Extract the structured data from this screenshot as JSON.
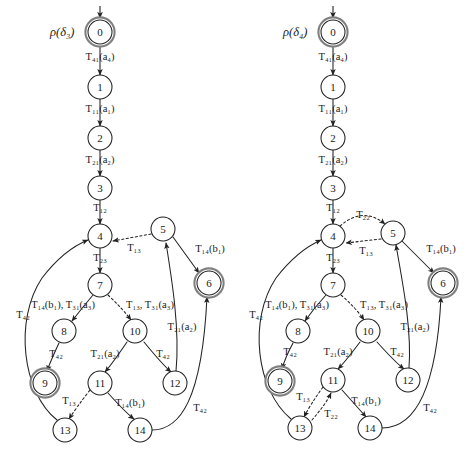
{
  "figure": {
    "type": "state-transition-diagram-pair",
    "background": "#ffffff",
    "stroke": "#222222",
    "accepting_ring": "#808080"
  },
  "diagrams": [
    {
      "id": "left",
      "title": "ρ(δ₃)",
      "title_pos": {
        "x": 50,
        "y": 36
      },
      "origin_x": 0,
      "nodes": [
        {
          "id": "0",
          "label": "0",
          "x": 100,
          "y": 32,
          "r": 12,
          "accepting": true
        },
        {
          "id": "1",
          "label": "1",
          "x": 100,
          "y": 87,
          "r": 12,
          "accepting": false
        },
        {
          "id": "2",
          "label": "2",
          "x": 100,
          "y": 138,
          "r": 12,
          "accepting": false
        },
        {
          "id": "3",
          "label": "3",
          "x": 100,
          "y": 188,
          "r": 12,
          "accepting": false
        },
        {
          "id": "4",
          "label": "4",
          "x": 100,
          "y": 236,
          "r": 12,
          "accepting": false
        },
        {
          "id": "5",
          "label": "5",
          "x": 163,
          "y": 229,
          "r": 12,
          "accepting": false
        },
        {
          "id": "6",
          "label": "6",
          "x": 209,
          "y": 283,
          "r": 12,
          "accepting": true
        },
        {
          "id": "7",
          "label": "7",
          "x": 100,
          "y": 285,
          "r": 12,
          "accepting": false
        },
        {
          "id": "8",
          "label": "8",
          "x": 64,
          "y": 331,
          "r": 12,
          "accepting": false
        },
        {
          "id": "9",
          "label": "9",
          "x": 45,
          "y": 383,
          "r": 12,
          "accepting": true
        },
        {
          "id": "10",
          "label": "10",
          "x": 135,
          "y": 331,
          "r": 12,
          "accepting": false
        },
        {
          "id": "11",
          "label": "11",
          "x": 100,
          "y": 383,
          "r": 12,
          "accepting": false
        },
        {
          "id": "12",
          "label": "12",
          "x": 175,
          "y": 383,
          "r": 12,
          "accepting": false
        },
        {
          "id": "13",
          "label": "13",
          "x": 65,
          "y": 430,
          "r": 12,
          "accepting": false
        },
        {
          "id": "14",
          "label": "14",
          "x": 140,
          "y": 430,
          "r": 12,
          "accepting": false
        }
      ],
      "start_arrow": {
        "x": 100,
        "y_from": 6,
        "y_to": 18
      },
      "edges": [
        {
          "from": "0",
          "to": "1",
          "label": "T₄₁(a₄)",
          "lx": 100,
          "ly": 60,
          "dotted": false,
          "anchor": "middle"
        },
        {
          "from": "1",
          "to": "2",
          "label": "T₁₁(a₁)",
          "lx": 100,
          "ly": 112,
          "dotted": false,
          "anchor": "middle"
        },
        {
          "from": "2",
          "to": "3",
          "label": "T₂₁(a₂)",
          "lx": 100,
          "ly": 163,
          "dotted": false,
          "anchor": "middle"
        },
        {
          "from": "3",
          "to": "4",
          "label": "T₁₂",
          "lx": 100,
          "ly": 211,
          "dotted": false,
          "anchor": "middle"
        },
        {
          "from": "5",
          "to": "4",
          "label": "T₁₃",
          "lx": 134,
          "ly": 251,
          "dotted": true,
          "anchor": "middle"
        },
        {
          "from": "5",
          "to": "6",
          "label": "T₁₄(b₁)",
          "lx": 210,
          "ly": 252,
          "dotted": false,
          "anchor": "middle"
        },
        {
          "from": "4",
          "to": "7",
          "label": "T₂₃",
          "lx": 100,
          "ly": 261,
          "dotted": false,
          "anchor": "middle"
        },
        {
          "from": "7",
          "to": "8",
          "label": "T₁₄(b₁), T₃₁(a₃)",
          "lx": 63,
          "ly": 308,
          "dotted": false,
          "anchor": "middle"
        },
        {
          "from": "7",
          "to": "10",
          "label": "T₁₃, T₃₁(a₃)",
          "lx": 150,
          "ly": 308,
          "dotted": true,
          "anchor": "middle"
        },
        {
          "from": "8",
          "to": "9",
          "label": "T₄₂",
          "lx": 56,
          "ly": 357,
          "dotted": false,
          "anchor": "middle"
        },
        {
          "from": "10",
          "to": "11",
          "label": "T₂₁(a₂)",
          "lx": 105,
          "ly": 357,
          "dotted": false,
          "anchor": "middle"
        },
        {
          "from": "10",
          "to": "12",
          "label": "T₄₂",
          "lx": 163,
          "ly": 357,
          "dotted": false,
          "anchor": "middle"
        },
        {
          "from": "11",
          "to": "13",
          "label": "T₁₃",
          "lx": 69,
          "ly": 404,
          "dotted": true,
          "anchor": "middle"
        },
        {
          "from": "11",
          "to": "14",
          "label": "T₁₄(b₁)",
          "lx": 130,
          "ly": 406,
          "dotted": false,
          "anchor": "middle"
        },
        {
          "from": "13",
          "to": "4",
          "label": "T₄₂",
          "lx": 23,
          "ly": 318,
          "dotted": false,
          "anchor": "middle"
        },
        {
          "from": "12",
          "to": "5",
          "label": "T₂₁(a₂)",
          "lx": 182,
          "ly": 330,
          "dotted": false,
          "anchor": "middle"
        },
        {
          "from": "14",
          "to": "6",
          "label": "T₄₂",
          "lx": 200,
          "ly": 411,
          "dotted": false,
          "anchor": "middle"
        }
      ],
      "paths": [
        {
          "name": "e-0-1",
          "d": "M100,44 L100,75",
          "dotted": false
        },
        {
          "name": "e-1-2",
          "d": "M100,99 L100,126",
          "dotted": false
        },
        {
          "name": "e-2-3",
          "d": "M100,150 L100,176",
          "dotted": false
        },
        {
          "name": "e-3-4",
          "d": "M100,200 L100,224",
          "dotted": false
        },
        {
          "name": "e-5-4",
          "d": "M151,234 L113,241",
          "dotted": true
        },
        {
          "name": "e-5-6",
          "d": "M173,237 L199,273",
          "dotted": false
        },
        {
          "name": "e-4-7",
          "d": "M100,248 L100,273",
          "dotted": false
        },
        {
          "name": "e-7-8",
          "d": "M93,295 Q82,308 72,321",
          "dotted": false
        },
        {
          "name": "e-7-10",
          "d": "M108,295 Q122,308 131,320",
          "dotted": true
        },
        {
          "name": "e-8-9",
          "d": "M59,343 Q51,360 47,371",
          "dotted": false
        },
        {
          "name": "e-10-11",
          "d": "M127,342 Q112,364 105,372",
          "dotted": false
        },
        {
          "name": "e-10-12",
          "d": "M144,342 Q162,364 171,372",
          "dotted": false
        },
        {
          "name": "e-11-13",
          "d": "M90,390 Q76,408 69,419",
          "dotted": true
        },
        {
          "name": "e-11-14",
          "d": "M108,393 Q126,413 134,419",
          "dotted": false
        },
        {
          "name": "e-13-4",
          "d": "M57,420 C22,392 14,320 42,278 C62,252 78,244 88,240",
          "dotted": false
        },
        {
          "name": "e-12-5",
          "d": "M176,371 C180,330 172,280 166,243",
          "dotted": false
        },
        {
          "name": "e-14-6",
          "d": "M152,430 C180,430 202,400 207,297",
          "dotted": false
        }
      ]
    },
    {
      "id": "right",
      "title": "ρ(δ₄)",
      "title_pos": {
        "x": 283,
        "y": 36
      },
      "origin_x": 235,
      "nodes": [
        {
          "id": "0",
          "label": "0",
          "x": 333,
          "y": 32,
          "r": 12,
          "accepting": true
        },
        {
          "id": "1",
          "label": "1",
          "x": 333,
          "y": 87,
          "r": 12,
          "accepting": false
        },
        {
          "id": "2",
          "label": "2",
          "x": 333,
          "y": 138,
          "r": 12,
          "accepting": false
        },
        {
          "id": "3",
          "label": "3",
          "x": 333,
          "y": 188,
          "r": 12,
          "accepting": false
        },
        {
          "id": "4",
          "label": "4",
          "x": 333,
          "y": 236,
          "r": 12,
          "accepting": false
        },
        {
          "id": "5",
          "label": "5",
          "x": 393,
          "y": 233,
          "r": 12,
          "accepting": false
        },
        {
          "id": "6",
          "label": "6",
          "x": 443,
          "y": 283,
          "r": 12,
          "accepting": true
        },
        {
          "id": "7",
          "label": "7",
          "x": 333,
          "y": 285,
          "r": 12,
          "accepting": false
        },
        {
          "id": "8",
          "label": "8",
          "x": 298,
          "y": 331,
          "r": 12,
          "accepting": false
        },
        {
          "id": "9",
          "label": "9",
          "x": 280,
          "y": 381,
          "r": 12,
          "accepting": true
        },
        {
          "id": "10",
          "label": "10",
          "x": 368,
          "y": 331,
          "r": 12,
          "accepting": false
        },
        {
          "id": "11",
          "label": "11",
          "x": 333,
          "y": 380,
          "r": 12,
          "accepting": false
        },
        {
          "id": "12",
          "label": "12",
          "x": 408,
          "y": 380,
          "r": 12,
          "accepting": false
        },
        {
          "id": "13",
          "label": "13",
          "x": 300,
          "y": 428,
          "r": 12,
          "accepting": false
        },
        {
          "id": "14",
          "label": "14",
          "x": 370,
          "y": 428,
          "r": 12,
          "accepting": false
        }
      ],
      "start_arrow": {
        "x": 333,
        "y_from": 6,
        "y_to": 18
      },
      "edges": [
        {
          "from": "0",
          "to": "1",
          "label": "T₄₁(a₄)",
          "lx": 333,
          "ly": 60,
          "dotted": false,
          "anchor": "middle"
        },
        {
          "from": "1",
          "to": "2",
          "label": "T₁₁(a₁)",
          "lx": 333,
          "ly": 112,
          "dotted": false,
          "anchor": "middle"
        },
        {
          "from": "2",
          "to": "3",
          "label": "T₂₁(a₂)",
          "lx": 333,
          "ly": 163,
          "dotted": false,
          "anchor": "middle"
        },
        {
          "from": "3",
          "to": "4",
          "label": "T₁₂",
          "lx": 333,
          "ly": 211,
          "dotted": false,
          "anchor": "middle"
        },
        {
          "from": "4",
          "to": "5",
          "label": "T₂₂",
          "lx": 363,
          "ly": 218,
          "dotted": true,
          "anchor": "middle"
        },
        {
          "from": "5",
          "to": "4",
          "label": "T₁₃",
          "lx": 366,
          "ly": 254,
          "dotted": true,
          "anchor": "middle"
        },
        {
          "from": "5",
          "to": "6",
          "label": "T₁₄(b₁)",
          "lx": 441,
          "ly": 252,
          "dotted": false,
          "anchor": "middle"
        },
        {
          "from": "4",
          "to": "7",
          "label": "T₂₃",
          "lx": 333,
          "ly": 261,
          "dotted": false,
          "anchor": "middle"
        },
        {
          "from": "7",
          "to": "8",
          "label": "T₁₄(b₁), T₃₁(a₃)",
          "lx": 297,
          "ly": 308,
          "dotted": false,
          "anchor": "middle"
        },
        {
          "from": "7",
          "to": "10",
          "label": "T₁₃, T₃₁(a₃)",
          "lx": 384,
          "ly": 308,
          "dotted": true,
          "anchor": "middle"
        },
        {
          "from": "8",
          "to": "9",
          "label": "T₄₂",
          "lx": 290,
          "ly": 355,
          "dotted": false,
          "anchor": "middle"
        },
        {
          "from": "10",
          "to": "11",
          "label": "T₂₁(a₂)",
          "lx": 338,
          "ly": 355,
          "dotted": false,
          "anchor": "middle"
        },
        {
          "from": "10",
          "to": "12",
          "label": "T₄₂",
          "lx": 397,
          "ly": 355,
          "dotted": false,
          "anchor": "middle"
        },
        {
          "from": "11",
          "to": "13",
          "label": "T₁₃",
          "lx": 303,
          "ly": 400,
          "dotted": true,
          "anchor": "middle"
        },
        {
          "from": "13",
          "to": "11",
          "label": "T₂₂",
          "lx": 331,
          "ly": 417,
          "dotted": true,
          "anchor": "middle"
        },
        {
          "from": "11",
          "to": "14",
          "label": "T₁₄(b₁)",
          "lx": 366,
          "ly": 404,
          "dotted": false,
          "anchor": "middle"
        },
        {
          "from": "13",
          "to": "4",
          "label": "T₄₂",
          "lx": 256,
          "ly": 318,
          "dotted": false,
          "anchor": "middle"
        },
        {
          "from": "12",
          "to": "5",
          "label": "T₂₁(a₂)",
          "lx": 415,
          "ly": 330,
          "dotted": false,
          "anchor": "middle"
        },
        {
          "from": "14",
          "to": "6",
          "label": "T₄₂",
          "lx": 430,
          "ly": 411,
          "dotted": false,
          "anchor": "middle"
        }
      ],
      "paths": [
        {
          "name": "e-0-1",
          "d": "M333,44 L333,75",
          "dotted": false
        },
        {
          "name": "e-1-2",
          "d": "M333,99 L333,126",
          "dotted": false
        },
        {
          "name": "e-2-3",
          "d": "M333,150 L333,176",
          "dotted": false
        },
        {
          "name": "e-3-4",
          "d": "M333,200 L333,224",
          "dotted": false
        },
        {
          "name": "e-4-5",
          "d": "M340,226 Q363,206 385,224",
          "dotted": true
        },
        {
          "name": "e-5-4",
          "d": "M381,239 L346,243",
          "dotted": true
        },
        {
          "name": "e-5-6",
          "d": "M402,241 L434,273",
          "dotted": false
        },
        {
          "name": "e-4-7",
          "d": "M333,248 L333,273",
          "dotted": false
        },
        {
          "name": "e-7-8",
          "d": "M326,295 Q314,308 305,321",
          "dotted": false
        },
        {
          "name": "e-7-10",
          "d": "M341,295 Q356,308 364,320",
          "dotted": true
        },
        {
          "name": "e-8-9",
          "d": "M293,343 Q285,358 282,369",
          "dotted": false
        },
        {
          "name": "e-10-11",
          "d": "M360,342 Q345,362 338,369",
          "dotted": false
        },
        {
          "name": "e-10-12",
          "d": "M377,342 Q395,362 404,369",
          "dotted": false
        },
        {
          "name": "e-11-13",
          "d": "M323,387 Q310,405 304,417",
          "dotted": true
        },
        {
          "name": "e-13-11",
          "d": "M312,420 Q326,404 331,393",
          "dotted": true
        },
        {
          "name": "e-11-14",
          "d": "M342,390 Q360,410 366,417",
          "dotted": false
        },
        {
          "name": "e-13-4",
          "d": "M291,419 C256,390 248,320 276,278 C296,252 312,244 321,240",
          "dotted": false
        },
        {
          "name": "e-12-5",
          "d": "M409,368 C412,328 402,280 396,245",
          "dotted": false
        },
        {
          "name": "e-14-6",
          "d": "M382,428 C410,428 436,400 441,297",
          "dotted": false
        }
      ]
    }
  ]
}
